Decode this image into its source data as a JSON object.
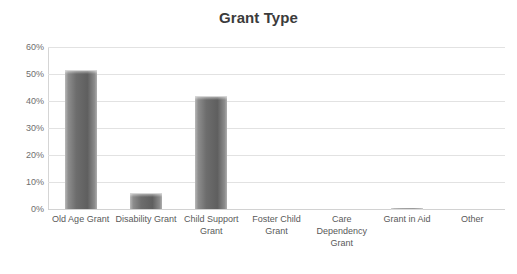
{
  "chart_data": {
    "type": "bar",
    "title": "Grant Type",
    "xlabel": "",
    "ylabel": "",
    "categories": [
      "Old Age Grant",
      "Disability Grant",
      "Child Support Grant",
      "Foster Child Grant",
      "Care Dependency Grant",
      "Grant in Aid",
      "Other"
    ],
    "values": [
      51.5,
      6.0,
      42.0,
      0.0,
      0.0,
      0.5,
      0.0
    ],
    "value_labels": [
      "51.5%",
      "6%",
      "42%",
      "0%",
      "0%",
      "0.5%",
      "0%"
    ],
    "ylim": [
      0,
      60
    ],
    "ytick_values": [
      0,
      10,
      20,
      30,
      40,
      50,
      60
    ],
    "ytick_labels": [
      "0%",
      "10%",
      "20%",
      "30%",
      "40%",
      "50%",
      "60%"
    ],
    "grid": true,
    "legend": false,
    "legend_position": "none",
    "series": [
      {
        "name": "Grant Type",
        "values": [
          51.5,
          6.0,
          42.0,
          0.0,
          0.0,
          0.5,
          0.0
        ],
        "color": "#6d6d6d"
      }
    ]
  },
  "colors": {
    "title": "#3b3b3b",
    "tick_text": "#6e6e6e",
    "category_text": "#595959",
    "gridline": "#e2e2e2",
    "axis": "#d5d5d5",
    "bar_fill": "#6d6d6d",
    "background": "#ffffff"
  }
}
